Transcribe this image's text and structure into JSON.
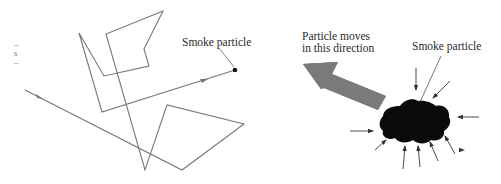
{
  "figure": {
    "left": {
      "label": "Smoke particle",
      "edge_fragments": [
        "–",
        "s",
        "–"
      ],
      "path_points": [
        [
          25,
          90
        ],
        [
          182,
          170
        ],
        [
          244,
          124
        ],
        [
          167,
          105
        ],
        [
          145,
          170
        ],
        [
          106,
          34
        ],
        [
          163,
          11
        ],
        [
          144,
          49
        ],
        [
          149,
          66
        ],
        [
          104,
          76
        ],
        [
          79,
          33
        ],
        [
          102,
          112
        ],
        [
          235,
          70
        ]
      ],
      "particle_point": [
        235,
        70
      ],
      "line_color": "#777777"
    },
    "right": {
      "direction_label_line1": "Particle moves",
      "direction_label_line2": "in this direction",
      "particle_label": "Smoke particle",
      "big_arrow_color": "#7a7a7a",
      "particle_color": "#0a0a0a",
      "impact_arrow_count": 10
    }
  }
}
